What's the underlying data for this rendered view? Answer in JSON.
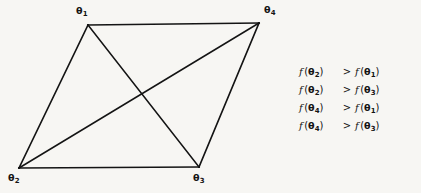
{
  "figure": {
    "background_color": "#f7f6f3",
    "line_color": "#141414",
    "graph": {
      "type": "quadrilateral-with-diagonals",
      "vertices": [
        {
          "id": "theta1",
          "label_base": "θ",
          "label_sub": "1",
          "x": 88,
          "y": 25,
          "label_x": 76,
          "label_y": 5
        },
        {
          "id": "theta2",
          "label_base": "θ",
          "label_sub": "2",
          "x": 19,
          "y": 168,
          "label_x": 8,
          "label_y": 172
        },
        {
          "id": "theta3",
          "label_base": "θ",
          "label_sub": "3",
          "x": 199,
          "y": 167,
          "label_x": 193,
          "label_y": 172
        },
        {
          "id": "theta4",
          "label_base": "θ",
          "label_sub": "4",
          "x": 259,
          "y": 23,
          "label_x": 264,
          "label_y": 4
        }
      ],
      "edges": [
        {
          "from": "theta1",
          "to": "theta4",
          "kind": "side"
        },
        {
          "from": "theta1",
          "to": "theta2",
          "kind": "side"
        },
        {
          "from": "theta2",
          "to": "theta3",
          "kind": "side"
        },
        {
          "from": "theta3",
          "to": "theta4",
          "kind": "side"
        },
        {
          "from": "theta1",
          "to": "theta3",
          "kind": "diagonal"
        },
        {
          "from": "theta2",
          "to": "theta4",
          "kind": "diagonal"
        }
      ]
    },
    "equations": [
      {
        "lhs_fn": "f",
        "lhs_base": "θ",
        "lhs_sub": "2",
        "op": ">",
        "rhs_fn": "f",
        "rhs_base": "θ",
        "rhs_sub": "1",
        "text": "f (θ₂) > f (θ₁)"
      },
      {
        "lhs_fn": "f",
        "lhs_base": "θ",
        "lhs_sub": "2",
        "op": ">",
        "rhs_fn": "f",
        "rhs_base": "θ",
        "rhs_sub": "3",
        "text": "f (θ₂) > f (θ₃)"
      },
      {
        "lhs_fn": "f",
        "lhs_base": "θ",
        "lhs_sub": "4",
        "op": ">",
        "rhs_fn": "f",
        "rhs_base": "θ",
        "rhs_sub": "1",
        "text": "f (θ₄) > f (θ₁)"
      },
      {
        "lhs_fn": "f",
        "lhs_base": "θ",
        "lhs_sub": "4",
        "op": ">",
        "rhs_fn": "f",
        "rhs_base": "θ",
        "rhs_sub": "3",
        "text": "f (θ₄) > f (θ₃)"
      }
    ]
  }
}
